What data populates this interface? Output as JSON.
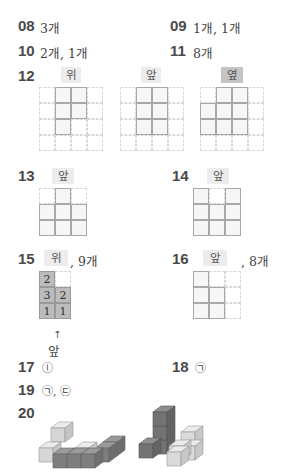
{
  "answers": {
    "q08": {
      "num": "08",
      "text": "3개"
    },
    "q09": {
      "num": "09",
      "text": "1개, 1개"
    },
    "q10": {
      "num": "10",
      "text": "2개, 1개"
    },
    "q11": {
      "num": "11",
      "text": "8개"
    },
    "q12": {
      "num": "12",
      "views": [
        {
          "label": "위",
          "cells": [
            [
              0,
              1,
              1,
              0
            ],
            [
              0,
              1,
              1,
              0
            ],
            [
              0,
              1,
              0,
              0
            ],
            [
              0,
              0,
              0,
              0
            ]
          ]
        },
        {
          "label": "앞",
          "cells": [
            [
              0,
              1,
              1,
              0
            ],
            [
              0,
              1,
              1,
              0
            ],
            [
              0,
              1,
              1,
              0
            ],
            [
              0,
              0,
              0,
              0
            ]
          ]
        },
        {
          "label": "옆",
          "cells": [
            [
              0,
              1,
              1,
              0
            ],
            [
              1,
              1,
              1,
              0
            ],
            [
              1,
              1,
              1,
              0
            ],
            [
              0,
              0,
              0,
              0
            ]
          ]
        }
      ]
    },
    "q13": {
      "num": "13",
      "label": "앞",
      "cells": [
        [
          0,
          1,
          0
        ],
        [
          1,
          1,
          1
        ],
        [
          1,
          1,
          1
        ]
      ]
    },
    "q14": {
      "num": "14",
      "label": "앞",
      "cells": [
        [
          1,
          0,
          1
        ],
        [
          1,
          1,
          1
        ],
        [
          1,
          1,
          1
        ]
      ]
    },
    "q15": {
      "num": "15",
      "label": "위",
      "suffix": ", 9개",
      "counts": [
        [
          "2",
          ""
        ],
        [
          "3",
          "2"
        ],
        [
          "1",
          "1"
        ]
      ],
      "front_label": "앞"
    },
    "q16": {
      "num": "16",
      "label": "앞",
      "suffix": ", 8개",
      "cells": [
        [
          1,
          0,
          0
        ],
        [
          1,
          1,
          0
        ],
        [
          1,
          1,
          0
        ]
      ]
    },
    "q17": {
      "num": "17",
      "text": "ⓛ"
    },
    "q18": {
      "num": "18",
      "text": "㉠"
    },
    "q19": {
      "num": "19",
      "text": "㉠, ㉢"
    },
    "q20": {
      "num": "20"
    }
  }
}
